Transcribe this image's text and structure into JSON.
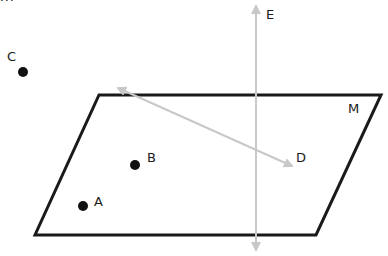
{
  "diagram": {
    "top_fragment": "m",
    "plane": {
      "label": "M",
      "corners": [
        [
          99,
          95
        ],
        [
          381,
          95
        ],
        [
          316,
          235
        ],
        [
          35,
          235
        ]
      ],
      "stroke": "#1a1a1a"
    },
    "points": [
      {
        "label": "A",
        "x": 83,
        "y": 206
      },
      {
        "label": "B",
        "x": 135,
        "y": 165
      },
      {
        "label": "C",
        "x": 23,
        "y": 72
      }
    ],
    "lines": [
      {
        "label": "D",
        "from": [
          118,
          88
        ],
        "to": [
          292,
          166
        ],
        "stroke": "#c8c8c8",
        "arrows": "both"
      },
      {
        "label": "E",
        "from": [
          256,
          5
        ],
        "to": [
          256,
          251
        ],
        "stroke": "#c8c8c8",
        "arrows": "both"
      }
    ],
    "labels": {
      "A": "A",
      "B": "B",
      "C": "C",
      "D": "D",
      "E": "E",
      "M": "M"
    }
  }
}
